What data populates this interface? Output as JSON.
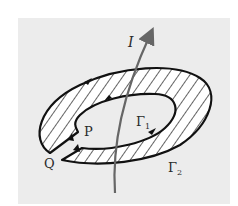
{
  "diagram": {
    "labels": {
      "current": "I",
      "point_p": "P",
      "point_q": "Q",
      "inner_curve": "Γ",
      "inner_curve_sub": "1",
      "outer_curve": "Γ",
      "outer_curve_sub": "2"
    },
    "colors": {
      "background": "#ffffff",
      "panel": "#ececec",
      "stroke": "#111111",
      "current_line": "#666666",
      "hatch_fill": "#ffffff"
    }
  }
}
